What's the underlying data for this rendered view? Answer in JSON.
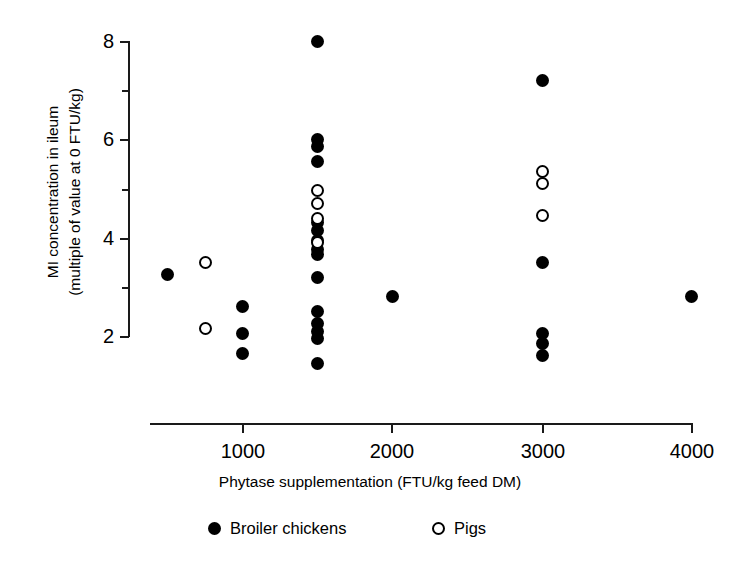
{
  "chart_data": {
    "type": "scatter",
    "title": "",
    "xlabel": "Phytase supplementation (FTU/kg feed DM)",
    "ylabel": "MI concentration in ileum\n(multiple of value at 0 FTU/kg)",
    "ylabel_line1": "MI concentration in ileum",
    "ylabel_line2": "(multiple of value at 0 FTU/kg)",
    "xlim": [
      0,
      4000
    ],
    "ylim": [
      1.2,
      8.3
    ],
    "xticks": [
      1000,
      2000,
      3000,
      4000
    ],
    "xticklabels": [
      "1000",
      "2000",
      "3000",
      "4000"
    ],
    "yticks": [
      2,
      4,
      6,
      8
    ],
    "yticklabels": [
      "2",
      "4",
      "6",
      "8"
    ],
    "yminorticks": [
      3,
      5,
      7
    ],
    "grid": false,
    "legend_position": "below-axis",
    "series": [
      {
        "name": "Broiler chickens",
        "marker": "filled-circle",
        "color": "#000000",
        "points": [
          {
            "x": 500,
            "y": 3.25
          },
          {
            "x": 1000,
            "y": 2.6
          },
          {
            "x": 1000,
            "y": 2.05
          },
          {
            "x": 1000,
            "y": 1.65
          },
          {
            "x": 1500,
            "y": 8.0
          },
          {
            "x": 1500,
            "y": 6.0
          },
          {
            "x": 1500,
            "y": 5.85
          },
          {
            "x": 1500,
            "y": 5.55
          },
          {
            "x": 1500,
            "y": 4.3
          },
          {
            "x": 1500,
            "y": 4.15
          },
          {
            "x": 1500,
            "y": 3.95
          },
          {
            "x": 1500,
            "y": 3.75
          },
          {
            "x": 1500,
            "y": 3.65
          },
          {
            "x": 1500,
            "y": 3.2
          },
          {
            "x": 1500,
            "y": 2.5
          },
          {
            "x": 1500,
            "y": 2.25
          },
          {
            "x": 1500,
            "y": 2.1
          },
          {
            "x": 1500,
            "y": 1.95
          },
          {
            "x": 1500,
            "y": 1.45
          },
          {
            "x": 2000,
            "y": 2.8
          },
          {
            "x": 3000,
            "y": 7.2
          },
          {
            "x": 3000,
            "y": 3.5
          },
          {
            "x": 3000,
            "y": 2.05
          },
          {
            "x": 3000,
            "y": 1.85
          },
          {
            "x": 3000,
            "y": 1.6
          },
          {
            "x": 4000,
            "y": 2.8
          }
        ]
      },
      {
        "name": "Pigs",
        "marker": "open-circle",
        "color": "#000000",
        "points": [
          {
            "x": 750,
            "y": 3.5
          },
          {
            "x": 750,
            "y": 2.15
          },
          {
            "x": 1500,
            "y": 4.95
          },
          {
            "x": 1500,
            "y": 4.7
          },
          {
            "x": 1500,
            "y": 4.4
          },
          {
            "x": 1500,
            "y": 3.9
          },
          {
            "x": 3000,
            "y": 5.35
          },
          {
            "x": 3000,
            "y": 5.1
          },
          {
            "x": 3000,
            "y": 4.45
          }
        ]
      }
    ],
    "legend": [
      {
        "label": "Broiler chickens",
        "marker": "filled-circle"
      },
      {
        "label": "Pigs",
        "marker": "open-circle"
      }
    ]
  }
}
